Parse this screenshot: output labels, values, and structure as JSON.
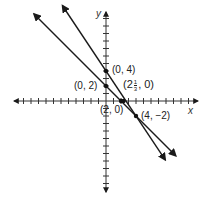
{
  "title": "",
  "axes": {
    "x_label": "x",
    "y_label": "y",
    "origin_px": [
      106,
      101
    ],
    "unit_px": 7.5,
    "x_range": [
      -12,
      12
    ],
    "y_range": [
      -12,
      12
    ]
  },
  "lines": [
    {
      "name": "line-1",
      "through": [
        [
          0,
          2
        ],
        [
          2,
          0
        ]
      ],
      "slope": -1,
      "color": "#1a1a1a"
    },
    {
      "name": "line-2",
      "through": [
        [
          0,
          4
        ],
        [
          4,
          -2
        ]
      ],
      "slope": -1.5,
      "color": "#1a1a1a"
    }
  ],
  "points": [
    {
      "label": "(0, 4)",
      "x": 0,
      "y": 4
    },
    {
      "label": "(0, 2)",
      "x": 0,
      "y": 2
    },
    {
      "label": "(2, 0)",
      "x": 2,
      "y": 0
    },
    {
      "label_whole": "2",
      "label_num": "1",
      "label_den": "3",
      "x": 2.333,
      "y": 0
    },
    {
      "label": "(4, −2)",
      "x": 4,
      "y": -2
    }
  ],
  "labels": {
    "p04": "(0, 4)",
    "p02": "(0, 2)",
    "p20": "(2, 0)",
    "p4m2": "(4, −2)",
    "frac_open": "(2",
    "frac_num": "1",
    "frac_den": "3",
    "frac_close": ", 0)"
  }
}
